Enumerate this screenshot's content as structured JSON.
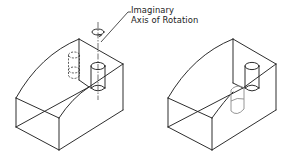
{
  "figure": {
    "annotation": {
      "line1": "Imaginary",
      "line2": "Axis of Rotation"
    },
    "views": [
      {
        "id": "before",
        "description": "Block with cylinder on top face; dashed cylinder shows original hidden position; axis of rotation drawn vertically through cylinder with rotation arrow symbol"
      },
      {
        "id": "after",
        "description": "Same block with cylinder rotated about axis; gray cylinder shows resulting position at front valley"
      }
    ],
    "colors": {
      "line": "#222222",
      "hidden_line": "#333333",
      "ghost_line": "#8a8a8a",
      "background": "#ffffff"
    }
  }
}
